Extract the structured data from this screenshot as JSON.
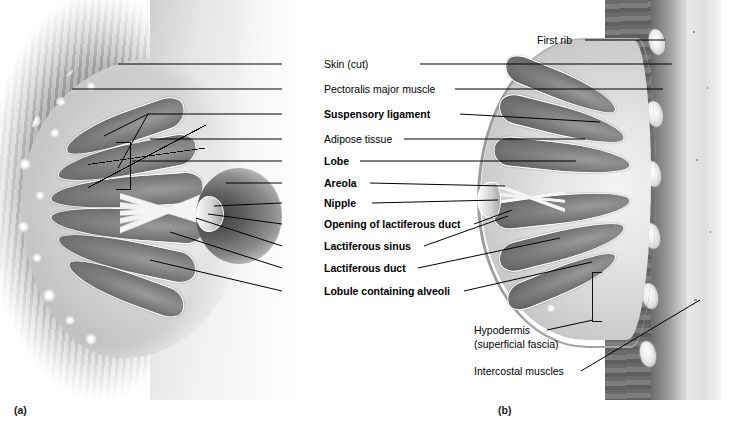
{
  "figure": {
    "background_color": "#ffffff",
    "line_color": "#000000",
    "label_color": "#000000"
  },
  "panels": [
    {
      "id": "a",
      "caption": "(a)",
      "view": "anterior view, partial cutaway",
      "x": 14,
      "y": 404
    },
    {
      "id": "b",
      "caption": "(b)",
      "view": "sagittal section",
      "x": 498,
      "y": 404
    }
  ],
  "center_labels": [
    {
      "key": "skin_cut",
      "text": "Skin (cut)",
      "bold": false,
      "y": 64,
      "text_x": 324,
      "left_line": {
        "x": 282,
        "w": 38
      },
      "right_line": {
        "x": 420,
        "w": 105
      }
    },
    {
      "key": "pectoralis",
      "text": "Pectoralis major muscle",
      "bold": false,
      "y": 89,
      "text_x": 324,
      "left_line": {
        "x": 282,
        "w": 38
      },
      "right_line": {
        "x": 455,
        "w": 70
      }
    },
    {
      "key": "suspensory_ligament",
      "text": "Suspensory ligament",
      "bold": true,
      "y": 114,
      "text_x": 324,
      "left_line": {
        "x": 282,
        "w": 38
      },
      "right_line": {
        "x": 460,
        "w": 65
      }
    },
    {
      "key": "adipose_tissue",
      "text": "Adipose tissue",
      "bold": false,
      "y": 139,
      "text_x": 324,
      "left_line": {
        "x": 282,
        "w": 38
      },
      "right_line": {
        "x": 404,
        "w": 121
      }
    },
    {
      "key": "lobe",
      "text": "Lobe",
      "bold": true,
      "y": 161,
      "text_x": 324,
      "left_line": {
        "x": 282,
        "w": 38
      },
      "right_line": {
        "x": 360,
        "w": 165
      }
    },
    {
      "key": "areola",
      "text": "Areola",
      "bold": true,
      "y": 183,
      "text_x": 324,
      "left_line": {
        "x": 282,
        "w": 38
      },
      "right_line": {
        "x": 370,
        "w": 155
      }
    },
    {
      "key": "nipple",
      "text": "Nipple",
      "bold": true,
      "y": 203,
      "text_x": 324,
      "left_line": {
        "x": 282,
        "w": 38
      },
      "right_line": {
        "x": 372,
        "w": 153
      }
    },
    {
      "key": "opening_lact_duct",
      "text": "Opening of lactiferous duct",
      "bold": true,
      "y": 224,
      "text_x": 324,
      "left_line": {
        "x": 282,
        "w": 38
      },
      "right_line": {
        "x": 474,
        "w": 38
      }
    },
    {
      "key": "lactiferous_sinus",
      "text": "Lactiferous sinus",
      "bold": true,
      "y": 246,
      "text_x": 324,
      "left_line": {
        "x": 282,
        "w": 38
      },
      "right_line": {
        "x": 424,
        "w": 32
      }
    },
    {
      "key": "lactiferous_duct",
      "text": "Lactiferous duct",
      "bold": true,
      "y": 268,
      "text_x": 324,
      "left_line": {
        "x": 282,
        "w": 38
      },
      "right_line": {
        "x": 418,
        "w": 34
      }
    },
    {
      "key": "lobule_alveoli",
      "text": "Lobule containing alveoli",
      "bold": true,
      "y": 291,
      "text_x": 324,
      "left_line": {
        "x": 282,
        "w": 38
      },
      "right_line": {
        "x": 464,
        "w": 28
      }
    }
  ],
  "right_labels": [
    {
      "key": "first_rib",
      "text": "First rib",
      "bold": false,
      "y": 40,
      "text_x": 537,
      "line": {
        "x": 585,
        "w": 80
      }
    }
  ],
  "lower_right_labels": [
    {
      "key": "hypodermis",
      "text": "Hypodermis",
      "line2": "(superficial fascia)",
      "bold": false,
      "y": 330,
      "text_x": 474,
      "line": {
        "x": 547,
        "w": 46
      }
    },
    {
      "key": "intercostal_muscles",
      "text": "Intercostal muscles",
      "bold": false,
      "y": 371,
      "text_x": 474,
      "line": {
        "x": 581,
        "w": 45
      }
    }
  ],
  "structures": {
    "panel_a": {
      "name": "anterior-cutaway-breast",
      "parts": [
        "adipose-lobules",
        "glandular-lobes",
        "lactiferous-ducts",
        "areola",
        "nipple",
        "pectoralis-striations"
      ]
    },
    "panel_b": {
      "name": "sagittal-section-breast",
      "parts": [
        "skin",
        "hypodermis",
        "glandular-lobes",
        "lactiferous-sinus",
        "nipple",
        "pectoralis-major",
        "ribs",
        "intercostal-muscles"
      ],
      "rib_count": 6
    }
  }
}
